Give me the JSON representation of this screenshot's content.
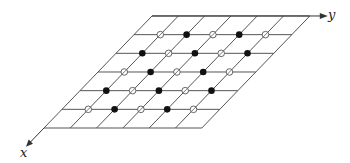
{
  "diagram": {
    "type": "lattice-grid",
    "axes": {
      "x_label": "x",
      "y_label": "y"
    },
    "grid": {
      "rows": 6,
      "cols": 6,
      "origin": [
        44,
        128
      ],
      "y_step": [
        26.3,
        0
      ],
      "x_step": [
        18.0,
        -18.67
      ],
      "line_color": "#555555",
      "line_width": 1
    },
    "points": {
      "legend": {
        "filled": "filled circle",
        "open": "open circle with slash"
      },
      "rows": [
        {
          "row": 5,
          "pattern": [
            "open",
            "filled",
            "open",
            "filled",
            "open"
          ]
        },
        {
          "row": 4,
          "pattern": [
            "filled",
            "open",
            "filled",
            "open",
            "filled"
          ]
        },
        {
          "row": 3,
          "pattern": [
            "open",
            "filled",
            "open",
            "filled",
            "open"
          ]
        },
        {
          "row": 2,
          "pattern": [
            "filled",
            "open",
            "filled",
            "open",
            "filled"
          ]
        },
        {
          "row": 1,
          "pattern": [
            "open",
            "filled",
            "open",
            "filled",
            "open"
          ]
        }
      ],
      "filled_color": "#111111",
      "open_color": "#555555"
    }
  }
}
